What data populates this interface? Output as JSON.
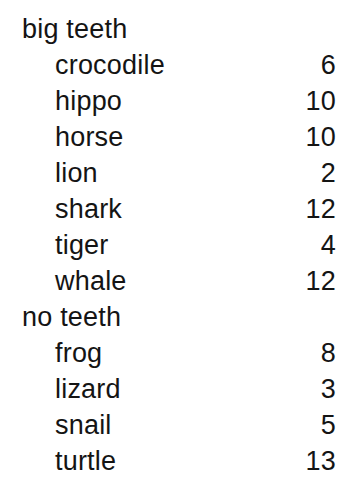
{
  "document": {
    "type": "index-listing",
    "text_color": "#141414",
    "background_color": "#ffffff",
    "groups": [
      {
        "heading": "big teeth",
        "entries": [
          {
            "label": "crocodile",
            "count": "6"
          },
          {
            "label": "hippo",
            "count": "10"
          },
          {
            "label": "horse",
            "count": "10"
          },
          {
            "label": "lion",
            "count": "2"
          },
          {
            "label": "shark",
            "count": "12"
          },
          {
            "label": "tiger",
            "count": "4"
          },
          {
            "label": "whale",
            "count": "12"
          }
        ]
      },
      {
        "heading": "no teeth",
        "entries": [
          {
            "label": "frog",
            "count": "8"
          },
          {
            "label": "lizard",
            "count": "3"
          },
          {
            "label": "snail",
            "count": "5"
          },
          {
            "label": "turtle",
            "count": "13"
          }
        ]
      }
    ]
  }
}
